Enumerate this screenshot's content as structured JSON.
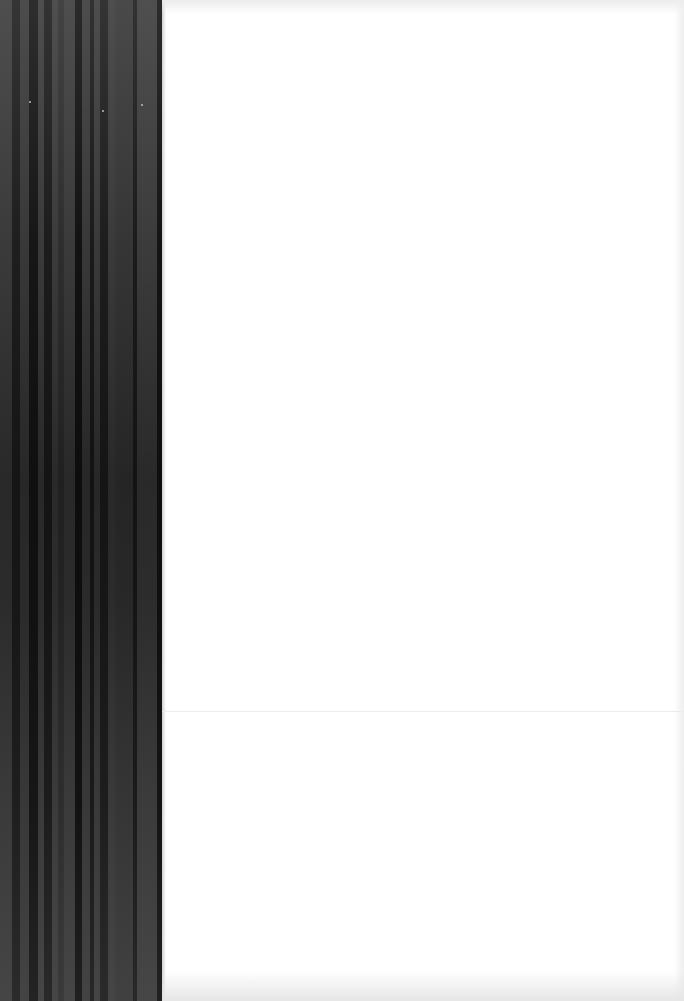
{
  "page": {
    "kind": "blank scanned page",
    "text": "",
    "background_color": "#ffffff",
    "fold_line_y": 711
  },
  "binding": {
    "width_px": 162,
    "stripes": [
      {
        "w": 12,
        "c": "#3a3a3a"
      },
      {
        "w": 8,
        "c": "#1e1e1e"
      },
      {
        "w": 9,
        "c": "#383838"
      },
      {
        "w": 9,
        "c": "#161616"
      },
      {
        "w": 6,
        "c": "#3a3a3a"
      },
      {
        "w": 8,
        "c": "#1c1c1c"
      },
      {
        "w": 6,
        "c": "#3b3b3b"
      },
      {
        "w": 6,
        "c": "#2e2e2e"
      },
      {
        "w": 11,
        "c": "#3a3a3a"
      },
      {
        "w": 7,
        "c": "#121212"
      },
      {
        "w": 8,
        "c": "#383838"
      },
      {
        "w": 4,
        "c": "#1a1a1a"
      },
      {
        "w": 6,
        "c": "#393939"
      },
      {
        "w": 8,
        "c": "#1d1d1d"
      },
      {
        "w": 7,
        "c": "#3a3a3a"
      },
      {
        "w": 18,
        "c": "#353535"
      },
      {
        "w": 4,
        "c": "#1b1b1b"
      },
      {
        "w": 20,
        "c": "#3b3b3b"
      },
      {
        "w": 5,
        "c": "#141414"
      }
    ],
    "specks": [
      {
        "x": 29,
        "y": 101
      },
      {
        "x": 102,
        "y": 110
      },
      {
        "x": 141,
        "y": 104
      }
    ]
  }
}
